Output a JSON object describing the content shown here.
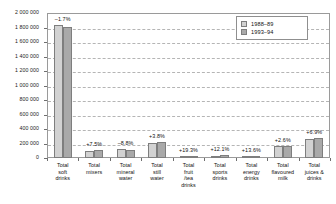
{
  "chart_data": {
    "type": "bar",
    "title": "",
    "xlabel": "",
    "ylabel": "",
    "ylim": [
      0,
      2000000
    ],
    "grid": true,
    "legend_position": "top-right",
    "y_ticks": [
      "0",
      "200 000",
      "400 000",
      "600 000",
      "800 000",
      "1 000 000",
      "1 200 000",
      "1 400 000",
      "1 600 000",
      "1 800 000",
      "2 000 000"
    ],
    "y_tick_values": [
      0,
      200000,
      400000,
      600000,
      800000,
      1000000,
      1200000,
      1400000,
      1600000,
      1800000,
      2000000
    ],
    "categories": [
      "Total soft drinks",
      "Total mixers",
      "Total mineral water",
      "Total still water",
      "Total fruit /tea drinks",
      "Total sports drinks",
      "Total energy drinks",
      "Total flavoured milk",
      "Total juices & drinks"
    ],
    "category_lines": [
      [
        "Total",
        "soft",
        "drinks"
      ],
      [
        "Total",
        "mixers"
      ],
      [
        "Total",
        "mineral",
        "water"
      ],
      [
        "Total",
        "still",
        "water"
      ],
      [
        "Total",
        "fruit",
        "/tea",
        "drinks"
      ],
      [
        "Total",
        "sports",
        "drinks"
      ],
      [
        "Total",
        "energy",
        "drinks"
      ],
      [
        "Total",
        "flavoured",
        "milk"
      ],
      [
        "Total",
        "juices &",
        "drinks"
      ]
    ],
    "series": [
      {
        "name": "1988–89",
        "color": "#d2d2d2",
        "values": [
          1840000,
          100000,
          122000,
          207000,
          28000,
          34000,
          26000,
          166000,
          264000
        ]
      },
      {
        "name": "1993–94",
        "color": "#a9a9a9",
        "values": [
          1808000,
          108000,
          111000,
          215000,
          33000,
          38000,
          30000,
          170000,
          282000
        ]
      }
    ],
    "annotations": [
      "–1.7%",
      "+7.5%",
      "–8.8%",
      "+3.8%",
      "+19.3%",
      "+12.1%",
      "+13.6%",
      "+2.6%",
      "+6.9%"
    ]
  },
  "legend": {
    "entries": [
      {
        "label": "1988–89"
      },
      {
        "label": "1993–94"
      }
    ]
  }
}
